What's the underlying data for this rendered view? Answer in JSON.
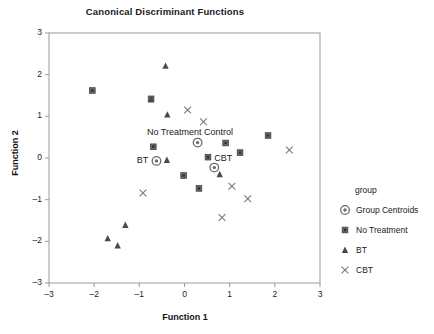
{
  "chart_data": {
    "type": "scatter",
    "title": "Canonical Discriminant Functions",
    "xlabel": "Function 1",
    "ylabel": "Function 2",
    "xlim": [
      -3,
      3
    ],
    "ylim": [
      -3,
      3
    ],
    "xticks": [
      "-3",
      "-2",
      "-1",
      "0",
      "1",
      "2",
      "3"
    ],
    "yticks": [
      "3",
      "2",
      "1",
      "0",
      "-1",
      "-2",
      "-3"
    ],
    "grid": false,
    "legend_position": "right",
    "legend_title": "group",
    "series": [
      {
        "name": "Group Centroids",
        "marker": "bullseye",
        "color": "#6b6b6b",
        "points": [
          {
            "x": -0.62,
            "y": -0.07
          },
          {
            "x": 0.29,
            "y": 0.37
          },
          {
            "x": 0.66,
            "y": -0.23
          }
        ]
      },
      {
        "name": "No Treatment",
        "marker": "square",
        "color": "#6b6b6b",
        "points": [
          {
            "x": -2.04,
            "y": 1.62
          },
          {
            "x": -0.74,
            "y": 1.42
          },
          {
            "x": -0.69,
            "y": 0.27
          },
          {
            "x": -0.02,
            "y": -0.42
          },
          {
            "x": 0.32,
            "y": -0.73
          },
          {
            "x": 0.52,
            "y": 0.02
          },
          {
            "x": 0.91,
            "y": 0.36
          },
          {
            "x": 1.23,
            "y": 0.13
          },
          {
            "x": 1.85,
            "y": 0.54
          }
        ]
      },
      {
        "name": "BT",
        "marker": "triangle",
        "color": "#4a4a4a",
        "points": [
          {
            "x": -0.42,
            "y": 2.21
          },
          {
            "x": -0.74,
            "y": 1.4
          },
          {
            "x": -0.38,
            "y": 1.04
          },
          {
            "x": -0.39,
            "y": -0.05
          },
          {
            "x": 0.78,
            "y": -0.39
          },
          {
            "x": -1.31,
            "y": -1.61
          },
          {
            "x": -1.7,
            "y": -1.93
          },
          {
            "x": -1.48,
            "y": -2.1
          }
        ]
      },
      {
        "name": "CBT",
        "marker": "cross",
        "color": "#7a7a7a",
        "points": [
          {
            "x": 0.07,
            "y": 1.15
          },
          {
            "x": 0.42,
            "y": 0.87
          },
          {
            "x": -0.92,
            "y": -0.84
          },
          {
            "x": 1.05,
            "y": -0.68
          },
          {
            "x": 1.4,
            "y": -0.98
          },
          {
            "x": 0.83,
            "y": -1.43
          },
          {
            "x": 2.32,
            "y": 0.19
          }
        ]
      }
    ],
    "annotations": [
      {
        "text": "No Treatment Control",
        "x": 0.12,
        "y": 0.6
      },
      {
        "text": "BT",
        "x": -0.93,
        "y": -0.07
      },
      {
        "text": "CBT",
        "x": 0.86,
        "y": -0.03
      }
    ]
  },
  "legend": {
    "title": "group",
    "entries": [
      {
        "label": "Group Centroids",
        "marker": "bullseye-icon"
      },
      {
        "label": "No Treatment",
        "marker": "square-icon"
      },
      {
        "label": "BT",
        "marker": "triangle-icon"
      },
      {
        "label": "CBT",
        "marker": "cross-icon"
      }
    ]
  },
  "caption": ""
}
